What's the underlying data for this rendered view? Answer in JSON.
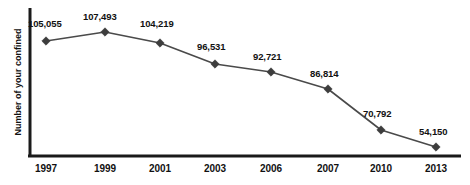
{
  "chart_data": {
    "type": "line",
    "title": "",
    "subtitle": "",
    "xlabel": "",
    "ylabel": "Number of your confined",
    "categories": [
      "1997",
      "1999",
      "2001",
      "2003",
      "2006",
      "2007",
      "2010",
      "2013"
    ],
    "values": [
      105055,
      107493,
      104219,
      96531,
      92721,
      86814,
      70792,
      54150
    ],
    "value_labels": [
      "105,055",
      "107,493",
      "104,219",
      "96,531",
      "92,721",
      "86,814",
      "70,792",
      "54,150"
    ],
    "series": [
      {
        "name": "Number of your confined",
        "values": [
          105055,
          107493,
          104219,
          96531,
          92721,
          86814,
          70792,
          54150
        ]
      }
    ],
    "ylim": [
      40000,
      112000
    ],
    "grid": false,
    "legend": "none",
    "marker": "diamond",
    "colors": {
      "line": "#4a4a4a",
      "marker": "#3d3d3d",
      "axis": "#1a1a1a",
      "text": "#111111",
      "background": "#ffffff"
    },
    "points": [
      {
        "category": "1997",
        "value": 105055,
        "label": "105,055",
        "x": 46,
        "y": 41,
        "label_x": 28,
        "label_y": 18
      },
      {
        "category": "1999",
        "value": 107493,
        "label": "107,493",
        "x": 105,
        "y": 32,
        "label_x": 83,
        "label_y": 11
      },
      {
        "category": "2001",
        "value": 104219,
        "label": "104,219",
        "x": 160,
        "y": 43,
        "label_x": 140,
        "label_y": 18
      },
      {
        "category": "2003",
        "value": 96531,
        "label": "96,531",
        "x": 215,
        "y": 64,
        "label_x": 197,
        "label_y": 41
      },
      {
        "category": "2006",
        "value": 92721,
        "label": "92,721",
        "x": 271,
        "y": 72,
        "label_x": 253,
        "label_y": 51
      },
      {
        "category": "2007",
        "value": 86814,
        "label": "86,814",
        "x": 328,
        "y": 89,
        "label_x": 310,
        "label_y": 68
      },
      {
        "category": "2010",
        "value": 70792,
        "label": "70,792",
        "x": 381,
        "y": 130,
        "label_x": 363,
        "label_y": 108
      },
      {
        "category": "2013",
        "value": 54150,
        "label": "54,150",
        "x": 436,
        "y": 147,
        "label_x": 419,
        "label_y": 126
      }
    ],
    "axis": {
      "y_line": {
        "x": 30,
        "y_top": 8,
        "y_bottom": 157
      },
      "x_line": {
        "y": 156,
        "x_left": 28,
        "x_right": 461
      }
    },
    "tick_positions": [
      46,
      105,
      160,
      215,
      271,
      328,
      381,
      436
    ],
    "tick_label_y": 163
  }
}
